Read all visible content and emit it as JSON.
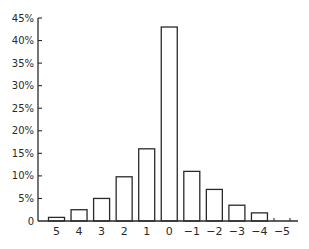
{
  "chart_data": {
    "type": "bar",
    "title": "",
    "xlabel": "",
    "ylabel": "",
    "categories": [
      "5",
      "4",
      "3",
      "2",
      "1",
      "0",
      "−1",
      "−2",
      "−3",
      "−4",
      "−5"
    ],
    "values": [
      0.8,
      2.5,
      5.0,
      9.8,
      16.0,
      43.0,
      11.0,
      7.0,
      3.5,
      1.8,
      0.2
    ],
    "value_unit": "%",
    "ylim": [
      0,
      45
    ],
    "yticks": [
      0,
      5,
      10,
      15,
      20,
      25,
      30,
      35,
      40,
      45
    ],
    "ytick_labels": [
      "0",
      "5%",
      "10%",
      "15%",
      "20%",
      "25%",
      "30%",
      "35%",
      "40%",
      "45%"
    ],
    "grid": false,
    "legend": null,
    "bar_fill": "#ffffff",
    "bar_stroke": "#2a2a2a",
    "axis_color": "#2a2a2a"
  }
}
